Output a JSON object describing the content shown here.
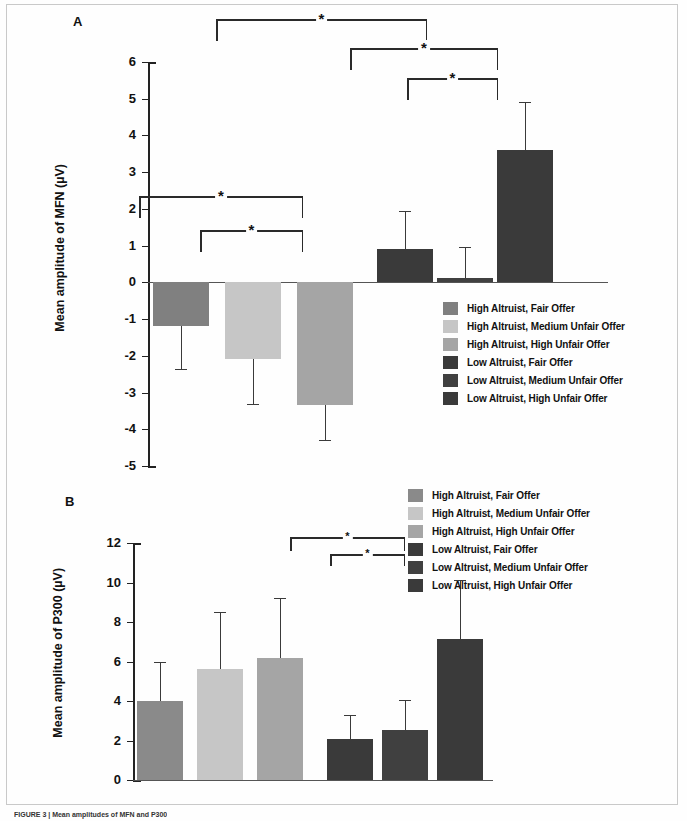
{
  "figure": {
    "caption": "FIGURE 3 | Mean amplitudes of MFN and P300",
    "panels": [
      "A",
      "B"
    ]
  },
  "panelA": {
    "letter": "A",
    "ylabel": "Mean amplitude of MFN (µV)",
    "yticks": [
      "6",
      "5",
      "4",
      "3",
      "2",
      "1",
      "0",
      "-1",
      "-2",
      "-3",
      "-4",
      "-5"
    ],
    "legend": [
      {
        "label": "High Altruist, Fair Offer",
        "color": "#808080"
      },
      {
        "label": "High Altruist, Medium Unfair Offer",
        "color": "#c6c6c6"
      },
      {
        "label": "High Altruist, High Unfair Offer",
        "color": "#a5a5a5"
      },
      {
        "label": "Low Altruist, Fair Offer",
        "color": "#3a3a3a"
      },
      {
        "label": "Low Altruist, Medium Unfair Offer",
        "color": "#404040"
      },
      {
        "label": "Low Altruist, High Unfair Offer",
        "color": "#3a3a3a"
      }
    ],
    "significance": [
      "*",
      "*",
      "*",
      "*",
      "*"
    ]
  },
  "panelB": {
    "letter": "B",
    "ylabel": "Mean amplitude of P300 (µV)",
    "yticks": [
      "12",
      "10",
      "8",
      "6",
      "4",
      "2",
      "0"
    ],
    "legend": [
      {
        "label": "High Altruist, Fair Offer",
        "color": "#8a8a8a"
      },
      {
        "label": "High Altruist, Medium Unfair Offer",
        "color": "#c6c6c6"
      },
      {
        "label": "High Altruist, High Unfair Offer",
        "color": "#a5a5a5"
      },
      {
        "label": "Low Altruist, Fair Offer",
        "color": "#3a3a3a"
      },
      {
        "label": "Low Altruist, Medium Unfair Offer",
        "color": "#404040"
      },
      {
        "label": "Low Altruist, High Unfair Offer",
        "color": "#3a3a3a"
      }
    ],
    "significance": [
      "*",
      "*"
    ]
  },
  "chart_data": [
    {
      "type": "bar",
      "title": "A",
      "xlabel": "",
      "ylabel": "Mean amplitude of MFN (µV)",
      "ylim": [
        -5,
        6
      ],
      "yticks": [
        -5,
        -4,
        -3,
        -2,
        -1,
        0,
        1,
        2,
        3,
        4,
        5,
        6
      ],
      "grid": false,
      "legend_position": "right",
      "categories": [
        "High Altruist, Fair Offer",
        "High Altruist, Medium Unfair Offer",
        "High Altruist, High Unfair Offer",
        "Low Altruist, Fair Offer",
        "Low Altruist, Medium Unfair Offer",
        "Low Altruist, High Unfair Offer"
      ],
      "values": [
        -1.2,
        -2.1,
        -3.35,
        0.9,
        0.12,
        3.6
      ],
      "errors": [
        1.15,
        1.2,
        0.95,
        1.05,
        0.85,
        1.3
      ],
      "colors": [
        "#808080",
        "#c6c6c6",
        "#a5a5a5",
        "#3a3a3a",
        "#404040",
        "#3a3a3a"
      ],
      "annotations": [
        {
          "text": "*",
          "between": [
            0,
            4
          ]
        },
        {
          "text": "*",
          "between": [
            1,
            2
          ]
        },
        {
          "text": "*",
          "between": [
            3,
            5
          ]
        },
        {
          "text": "*",
          "between": [
            4,
            5
          ]
        },
        {
          "text": "*",
          "between": [
            0,
            5
          ]
        }
      ]
    },
    {
      "type": "bar",
      "title": "B",
      "xlabel": "",
      "ylabel": "Mean amplitude of P300 (µV)",
      "ylim": [
        0,
        12
      ],
      "yticks": [
        0,
        2,
        4,
        6,
        8,
        10,
        12
      ],
      "grid": false,
      "legend_position": "right",
      "categories": [
        "High Altruist, Fair Offer",
        "High Altruist, Medium Unfair Offer",
        "High Altruist, High Unfair Offer",
        "Low Altruist, Fair Offer",
        "Low Altruist, Medium Unfair Offer",
        "Low Altruist, High Unfair Offer"
      ],
      "values": [
        4.0,
        5.6,
        6.2,
        2.1,
        2.55,
        7.15
      ],
      "errors": [
        1.95,
        2.9,
        3.0,
        1.2,
        1.5,
        3.0
      ],
      "colors": [
        "#8a8a8a",
        "#c6c6c6",
        "#a5a5a5",
        "#3a3a3a",
        "#404040",
        "#3a3a3a"
      ],
      "annotations": [
        {
          "text": "*",
          "between": [
            3,
            5
          ]
        },
        {
          "text": "*",
          "between": [
            4,
            5
          ]
        }
      ]
    }
  ]
}
